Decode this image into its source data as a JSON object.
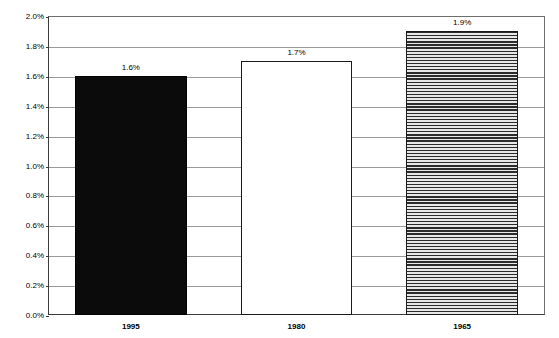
{
  "chart_data": {
    "type": "bar",
    "title": "",
    "subtitle": "",
    "xlabel": "",
    "ylabel": "Population Growth",
    "categories": [
      "1995",
      "1980",
      "1965"
    ],
    "values": [
      1.6,
      1.7,
      1.9
    ],
    "value_labels": [
      "1.6%",
      "1.7%",
      "1.9%"
    ],
    "ylim": [
      0.0,
      2.0
    ],
    "ytick_values": [
      0.0,
      0.2,
      0.4,
      0.6,
      0.8,
      1.0,
      1.2,
      1.4,
      1.6,
      1.8,
      2.0
    ],
    "ytick_labels": [
      "0.0%",
      "0.2%",
      "0.4%",
      "0.6%",
      "0.8%",
      "1.0%",
      "1.2%",
      "1.4%",
      "1.6%",
      "1.8%",
      "2.0%"
    ],
    "grid": true,
    "grid_axis": "y",
    "legend": false,
    "legend_position": "none",
    "series": [
      {
        "name": "Population Growth",
        "values": [
          1.6,
          1.7,
          1.9
        ],
        "point_styles": [
          "solid-black",
          "unfilled-white",
          "horizontal-hatch"
        ]
      }
    ],
    "bar_styles": [
      {
        "category": "1995",
        "value": 1.6,
        "label": "1.6%",
        "fill": "fill-solid",
        "color": "#0b0b0b"
      },
      {
        "category": "1980",
        "value": 1.7,
        "label": "1.7%",
        "fill": "fill-none",
        "color": "#ffffff"
      },
      {
        "category": "1965",
        "value": 1.9,
        "label": "1.9%",
        "fill": "fill-hatch-horizontal",
        "color": "#d9d9d9"
      }
    ],
    "colors": {
      "axis": "#3b3b3b",
      "gridline": "#9a9a9a",
      "plot_background": "#ffffff",
      "text": "#000000",
      "bar_1995": "#0b0b0b",
      "bar_1980": "#ffffff",
      "bar_1965": "#d9d9d9"
    }
  }
}
